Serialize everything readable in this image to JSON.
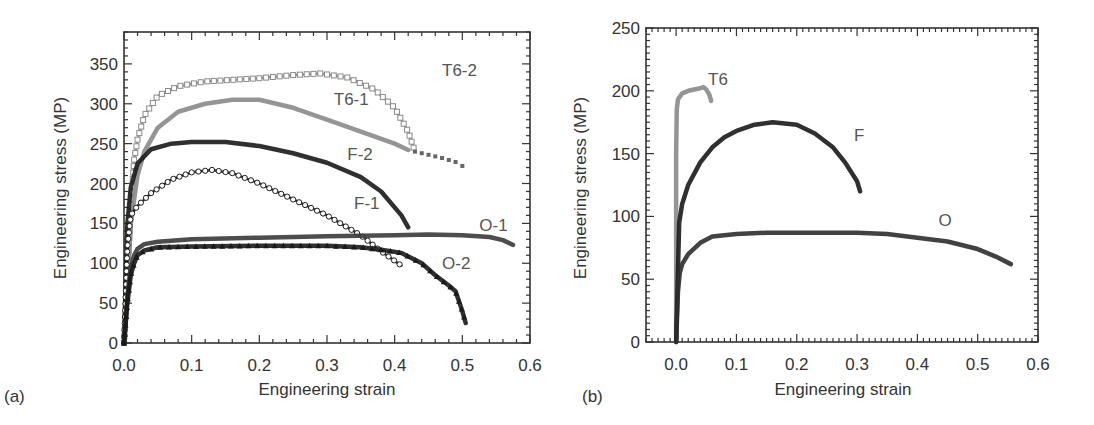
{
  "chart_data": [
    {
      "panel": "(a)",
      "type": "scatter",
      "xlabel": "Engineering strain",
      "ylabel": "Engineering stress (MP)",
      "xlim": [
        0.0,
        0.6
      ],
      "ylim": [
        0,
        390
      ],
      "xticks": [
        "0.0",
        "0.1",
        "0.2",
        "0.3",
        "0.4",
        "0.5",
        "0.6"
      ],
      "yticks": [
        "0",
        "50",
        "100",
        "150",
        "200",
        "250",
        "300",
        "350"
      ],
      "grid": false,
      "legend": "inline labels",
      "series": [
        {
          "name": "T6-2",
          "color": "#8a8a8a",
          "marker": "open-square",
          "label_pos": [
            0.47,
            335
          ],
          "x": [
            0.0,
            0.005,
            0.01,
            0.015,
            0.02,
            0.03,
            0.05,
            0.08,
            0.12,
            0.2,
            0.25,
            0.29,
            0.33,
            0.37,
            0.4,
            0.42,
            0.43
          ],
          "y": [
            0,
            80,
            170,
            230,
            255,
            285,
            310,
            322,
            328,
            332,
            336,
            338,
            333,
            318,
            295,
            265,
            240
          ]
        },
        {
          "name": "T6-2 tail",
          "color": "#666666",
          "marker": "dot",
          "label_pos": null,
          "x": [
            0.43,
            0.45,
            0.47,
            0.49,
            0.5
          ],
          "y": [
            240,
            236,
            232,
            227,
            222
          ]
        },
        {
          "name": "T6-1",
          "color": "#8a8a8a",
          "marker": "filled-square",
          "label_pos": [
            0.31,
            298
          ],
          "x": [
            0.0,
            0.01,
            0.02,
            0.03,
            0.05,
            0.08,
            0.12,
            0.16,
            0.2,
            0.25,
            0.3,
            0.35,
            0.4,
            0.42
          ],
          "y": [
            0,
            150,
            210,
            240,
            270,
            290,
            300,
            305,
            305,
            295,
            280,
            265,
            250,
            242
          ]
        },
        {
          "name": "F-2",
          "color": "#1a1a1a",
          "marker": "filled-circle",
          "label_pos": [
            0.33,
            230
          ],
          "x": [
            0.0,
            0.005,
            0.01,
            0.02,
            0.04,
            0.07,
            0.1,
            0.15,
            0.2,
            0.25,
            0.3,
            0.35,
            0.38,
            0.41,
            0.42
          ],
          "y": [
            0,
            150,
            195,
            225,
            243,
            250,
            252,
            252,
            247,
            238,
            226,
            208,
            190,
            160,
            145
          ]
        },
        {
          "name": "F-1",
          "color": "#1a1a1a",
          "marker": "open-circle",
          "label_pos": [
            0.34,
            168
          ],
          "x": [
            0.0,
            0.005,
            0.01,
            0.02,
            0.04,
            0.07,
            0.1,
            0.13,
            0.16,
            0.2,
            0.25,
            0.3,
            0.35,
            0.38,
            0.41
          ],
          "y": [
            0,
            120,
            160,
            172,
            188,
            205,
            214,
            217,
            213,
            200,
            180,
            160,
            135,
            115,
            97
          ]
        },
        {
          "name": "O-1",
          "color": "#3a3a3a",
          "marker": "filled-square",
          "label_pos": [
            0.525,
            140
          ],
          "x": [
            0.0,
            0.005,
            0.01,
            0.015,
            0.02,
            0.03,
            0.05,
            0.1,
            0.2,
            0.3,
            0.4,
            0.45,
            0.5,
            0.54,
            0.56,
            0.575
          ],
          "y": [
            0,
            60,
            95,
            110,
            118,
            124,
            127,
            130,
            132,
            134,
            135,
            136,
            135,
            133,
            129,
            123
          ]
        },
        {
          "name": "O-2",
          "color": "#1a1a1a",
          "marker": "filled-triangle",
          "label_pos": [
            0.47,
            93
          ],
          "x": [
            0.0,
            0.005,
            0.01,
            0.015,
            0.02,
            0.03,
            0.05,
            0.1,
            0.2,
            0.3,
            0.35,
            0.38,
            0.41,
            0.44,
            0.46,
            0.48,
            0.49,
            0.5,
            0.505
          ],
          "y": [
            0,
            50,
            85,
            100,
            110,
            116,
            120,
            121,
            122,
            122,
            120,
            117,
            113,
            100,
            85,
            72,
            65,
            40,
            25
          ]
        }
      ]
    },
    {
      "panel": "(b)",
      "type": "scatter",
      "xlabel": "Engineering strain",
      "ylabel": "Engineering stress (MP)",
      "xlim": [
        -0.05,
        0.6
      ],
      "ylim": [
        0,
        250
      ],
      "xticks": [
        "0.0",
        "0.1",
        "0.2",
        "0.3",
        "0.4",
        "0.5",
        "0.6"
      ],
      "yticks": [
        "0",
        "50",
        "100",
        "150",
        "200",
        "250"
      ],
      "grid": false,
      "legend": "inline labels",
      "series": [
        {
          "name": "T6",
          "color": "#8a8a8a",
          "marker": "filled-square",
          "label_pos": [
            0.053,
            205
          ],
          "x": [
            0.0,
            0.0,
            0.0,
            0.0,
            0.001,
            0.003,
            0.01,
            0.02,
            0.03,
            0.04,
            0.045,
            0.05,
            0.055,
            0.058
          ],
          "y": [
            0,
            50,
            100,
            150,
            185,
            193,
            198,
            200,
            201,
            202,
            203,
            201,
            197,
            192
          ]
        },
        {
          "name": "F",
          "color": "#1a1a1a",
          "marker": "filled-diamond",
          "label_pos": [
            0.295,
            160
          ],
          "x": [
            0.0,
            0.005,
            0.01,
            0.02,
            0.04,
            0.06,
            0.08,
            0.1,
            0.13,
            0.16,
            0.2,
            0.23,
            0.26,
            0.28,
            0.3,
            0.305
          ],
          "y": [
            0,
            95,
            110,
            125,
            143,
            155,
            163,
            168,
            173,
            175,
            173,
            166,
            155,
            143,
            128,
            120
          ]
        },
        {
          "name": "O",
          "color": "#2e2e2e",
          "marker": "filled-circle",
          "label_pos": [
            0.435,
            92
          ],
          "x": [
            0.0,
            0.003,
            0.006,
            0.01,
            0.02,
            0.04,
            0.06,
            0.1,
            0.15,
            0.2,
            0.3,
            0.35,
            0.4,
            0.45,
            0.5,
            0.53,
            0.555
          ],
          "y": [
            0,
            40,
            55,
            62,
            70,
            79,
            84,
            86,
            87,
            87,
            87,
            86,
            83,
            80,
            74,
            68,
            62
          ]
        }
      ]
    }
  ],
  "panels": {
    "a": {
      "label": "(a)",
      "xlabel": "Engineering strain",
      "ylabel": "Engineering stress (MP)"
    },
    "b": {
      "label": "(b)",
      "xlabel": "Engineering strain",
      "ylabel": "Engineering stress (MP)"
    }
  }
}
